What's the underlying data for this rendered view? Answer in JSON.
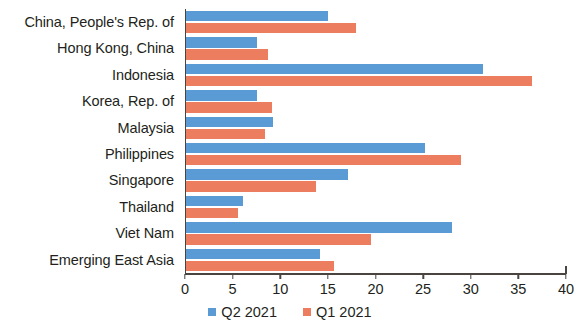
{
  "chart_data": {
    "type": "bar",
    "orientation": "horizontal",
    "title": "",
    "xlabel": "",
    "ylabel": "",
    "xlim": [
      0,
      40
    ],
    "xticks": [
      0,
      5,
      10,
      15,
      20,
      25,
      30,
      35,
      40
    ],
    "xtick_labels": [
      "0",
      "5",
      "10",
      "15",
      "20",
      "25",
      "30",
      "35",
      "40"
    ],
    "grid": false,
    "legend_position": "bottom",
    "categories": [
      "China, People's Rep. of",
      "Hong Kong, China",
      "Indonesia",
      "Korea, Rep. of",
      "Malaysia",
      "Philippines",
      "Singapore",
      "Thailand",
      "Viet Nam",
      "Emerging East Asia"
    ],
    "series": [
      {
        "name": "Q2 2021",
        "color": "#5b9bd5",
        "values": [
          14.9,
          7.5,
          31.2,
          7.5,
          9.1,
          25.1,
          17.0,
          6.0,
          27.9,
          14.1
        ]
      },
      {
        "name": "Q1 2021",
        "color": "#ed7d5f",
        "values": [
          17.8,
          8.6,
          36.3,
          9.0,
          8.3,
          28.9,
          13.6,
          5.5,
          19.4,
          15.5
        ]
      }
    ]
  },
  "legend": {
    "items": [
      {
        "label": "Q2 2021",
        "color": "#5b9bd5"
      },
      {
        "label": "Q1 2021",
        "color": "#ed7d5f"
      }
    ]
  },
  "colors": {
    "q2_blue": "#5b9bd5",
    "q1_orange": "#ed7d5f",
    "axis": "#4a4441",
    "text": "#231f20",
    "background": "#ffffff"
  }
}
